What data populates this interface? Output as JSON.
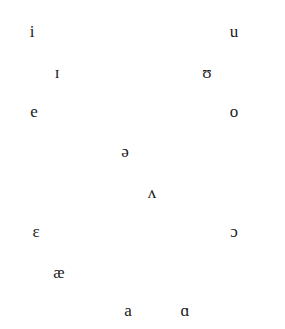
{
  "diagram": {
    "type": "ipa-vowel-chart",
    "vowels": [
      {
        "symbol": "i",
        "x": 32,
        "y": 31
      },
      {
        "symbol": "u",
        "x": 234,
        "y": 31
      },
      {
        "symbol": "ɪ",
        "x": 57,
        "y": 72
      },
      {
        "symbol": "ʊ",
        "x": 207,
        "y": 72
      },
      {
        "symbol": "e",
        "x": 34,
        "y": 111
      },
      {
        "symbol": "o",
        "x": 234,
        "y": 111
      },
      {
        "symbol": "ə",
        "x": 125,
        "y": 151
      },
      {
        "symbol": "ʌ",
        "x": 152,
        "y": 192
      },
      {
        "symbol": "ɛ",
        "x": 36,
        "y": 231
      },
      {
        "symbol": "ɔ",
        "x": 234,
        "y": 231
      },
      {
        "symbol": "æ",
        "x": 59,
        "y": 272
      },
      {
        "symbol": "a",
        "x": 128,
        "y": 310
      },
      {
        "symbol": "ɑ",
        "x": 185,
        "y": 310
      }
    ]
  }
}
